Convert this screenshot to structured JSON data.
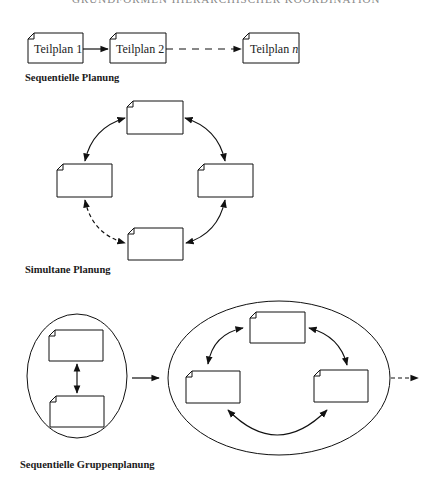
{
  "header": {
    "text": "GRUNDFORMEN HIERARCHISCHER KOORDINATION",
    "note": "partially cut off at top edge"
  },
  "sequential": {
    "label": "Sequentielle Planung",
    "boxes": [
      {
        "label": "Teilplan 1"
      },
      {
        "label": "Teilplan 2"
      },
      {
        "label": "Teilplan ",
        "italic_suffix": "n"
      }
    ],
    "connectors": [
      "solid-arrow",
      "dashed-arrow"
    ]
  },
  "simultaneous": {
    "label": "Simultane Planung",
    "boxes": [
      "top",
      "left",
      "right",
      "bottom"
    ],
    "connectors": [
      {
        "from": "top",
        "to": "left",
        "style": "solid",
        "bidirectional": true
      },
      {
        "from": "top",
        "to": "right",
        "style": "solid",
        "bidirectional": true
      },
      {
        "from": "right",
        "to": "bottom",
        "style": "solid",
        "bidirectional": true
      },
      {
        "from": "bottom",
        "to": "left",
        "style": "dashed",
        "bidirectional": true
      }
    ]
  },
  "group": {
    "label": "Sequentielle Gruppenplanung",
    "groups": [
      {
        "shape": "ellipse",
        "boxes": 2,
        "connector": "vertical-bidirectional"
      },
      {
        "shape": "ellipse",
        "boxes": 3,
        "connector": "circular-bidirectional"
      }
    ],
    "connectors": [
      "solid-arrow-between-groups",
      "dashed-arrow-out"
    ]
  }
}
